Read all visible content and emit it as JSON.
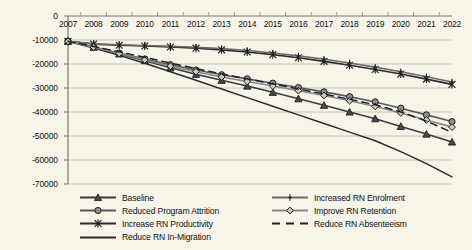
{
  "chart_data": {
    "type": "line",
    "title": "",
    "xlabel": "",
    "ylabel": "",
    "x": [
      2007,
      2008,
      2009,
      2010,
      2011,
      2012,
      2013,
      2014,
      2015,
      2016,
      2017,
      2018,
      2019,
      2020,
      2021,
      2022
    ],
    "categories": [
      "2007",
      "2008",
      "2009",
      "2010",
      "2011",
      "2012",
      "2013",
      "2014",
      "2015",
      "2016",
      "2017",
      "2018",
      "2019",
      "2020",
      "2021",
      "2022"
    ],
    "ylim": [
      -70000,
      0
    ],
    "ytick_values": [
      0,
      -10000,
      -20000,
      -30000,
      -40000,
      -50000,
      -60000,
      -70000
    ],
    "ytick_labels": [
      "0",
      "-10000",
      "-20000",
      "-30000",
      "-40000",
      "-50000",
      "-60000",
      "-70000"
    ],
    "grid": true,
    "legend_position": "bottom",
    "series": [
      {
        "name": "Baseline",
        "marker": "triangle",
        "dash": "solid",
        "color": "#3b3b3b",
        "values": [
          -10500,
          -13000,
          -15800,
          -18600,
          -21600,
          -24300,
          -26800,
          -29200,
          -31800,
          -34500,
          -37200,
          -40000,
          -42800,
          -46000,
          -49200,
          -52500
        ]
      },
      {
        "name": "Reduced Program Attrition",
        "marker": "circle",
        "dash": "solid",
        "color": "#5a5a5a",
        "values": [
          -10500,
          -12900,
          -15400,
          -17900,
          -20300,
          -22500,
          -24500,
          -26200,
          -28000,
          -29800,
          -31600,
          -33600,
          -35800,
          -38400,
          -41200,
          -44000
        ]
      },
      {
        "name": "Increase RN Productivity",
        "marker": "asterisk",
        "dash": "solid",
        "color": "#2b2b2b",
        "values": [
          -10500,
          -11700,
          -12200,
          -12500,
          -12900,
          -13400,
          -14100,
          -15000,
          -16100,
          -17400,
          -18900,
          -20500,
          -22300,
          -24200,
          -26300,
          -28500
        ]
      },
      {
        "name": "Reduce RN In-Migration",
        "marker": "none",
        "dash": "solid",
        "color": "#2b2b2b",
        "values": [
          -10500,
          -13300,
          -16400,
          -19700,
          -23200,
          -26800,
          -30400,
          -34000,
          -37600,
          -41200,
          -44800,
          -48400,
          -52000,
          -56500,
          -61500,
          -67000
        ]
      },
      {
        "name": "Increased RN Enrolment",
        "marker": "plus",
        "dash": "solid",
        "color": "#6b6b6b",
        "values": [
          -10500,
          -11600,
          -12000,
          -12300,
          -12600,
          -13000,
          -13600,
          -14400,
          -15400,
          -16600,
          -18000,
          -19600,
          -21300,
          -23200,
          -25300,
          -27500
        ]
      },
      {
        "name": "Improve RN Retention",
        "marker": "diamond",
        "dash": "solid",
        "color": "#878787",
        "values": [
          -10500,
          -13000,
          -15600,
          -18300,
          -20900,
          -23200,
          -25400,
          -27300,
          -29200,
          -31100,
          -33100,
          -35300,
          -37700,
          -40400,
          -43300,
          -46300
        ]
      },
      {
        "name": "Reduce RN Absenteeism",
        "marker": "none",
        "dash": "dashed",
        "color": "#222222",
        "values": [
          -10500,
          -12700,
          -14900,
          -17200,
          -19600,
          -21900,
          -24100,
          -26200,
          -28300,
          -30400,
          -32500,
          -34700,
          -37000,
          -40000,
          -43800,
          -48500
        ]
      }
    ]
  },
  "legend": {
    "items": [
      {
        "label": "Baseline",
        "key": "legend-key-baseline"
      },
      {
        "label": "Increased RN Enrolment",
        "key": "legend-key-increased-rn-enrolment"
      },
      {
        "label": "Reduced Program Attrition",
        "key": "legend-key-reduced-program-attrition"
      },
      {
        "label": "Improve RN Retention",
        "key": "legend-key-improve-rn-retention"
      },
      {
        "label": "Increase RN Productivity",
        "key": "legend-key-increase-rn-productivity"
      },
      {
        "label": "Reduce RN Absenteeism",
        "key": "legend-key-reduce-rn-absenteeism"
      },
      {
        "label": "Reduce RN In-Migration",
        "key": "legend-key-reduce-rn-in-migration"
      }
    ]
  },
  "colors": {
    "background": "#f7f4ea",
    "gridline": "#b9b6ab",
    "axis": "#8a8780",
    "text": "#111111"
  }
}
